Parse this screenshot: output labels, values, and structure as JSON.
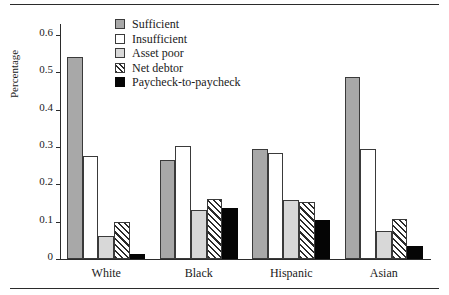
{
  "chart_data": {
    "type": "bar",
    "title": "",
    "xlabel": "",
    "ylabel": "Percentage",
    "ylim": [
      0,
      0.63
    ],
    "yticks": [
      "0",
      "0.1",
      "0.2",
      "0.3",
      "0.4",
      "0.5",
      "0.6"
    ],
    "ytick_values": [
      0,
      0.1,
      0.2,
      0.3,
      0.4,
      0.5,
      0.6
    ],
    "grid": false,
    "legend_position": "top-center",
    "categories": [
      "White",
      "Black",
      "Hispanic",
      "Asian"
    ],
    "series": [
      {
        "name": "Sufficient",
        "key": "sufficient",
        "color": "#a8a8a8",
        "pattern": "solid",
        "values": [
          0.542,
          0.265,
          0.294,
          0.488
        ]
      },
      {
        "name": "Insufficient",
        "key": "insufficient",
        "color": "#ffffff",
        "pattern": "solid",
        "values": [
          0.277,
          0.302,
          0.285,
          0.295
        ]
      },
      {
        "name": "Asset poor",
        "key": "assetpoor",
        "color": "#d8d8d8",
        "pattern": "solid",
        "values": [
          0.061,
          0.131,
          0.157,
          0.075
        ]
      },
      {
        "name": "Net debtor",
        "key": "netdebtor",
        "color": "#ffffff",
        "pattern": "diagonal-hatch",
        "values": [
          0.099,
          0.162,
          0.153,
          0.106
        ]
      },
      {
        "name": "Paycheck-to-paycheck",
        "key": "paycheck",
        "color": "#050505",
        "pattern": "solid",
        "values": [
          0.013,
          0.138,
          0.105,
          0.035
        ]
      }
    ]
  }
}
